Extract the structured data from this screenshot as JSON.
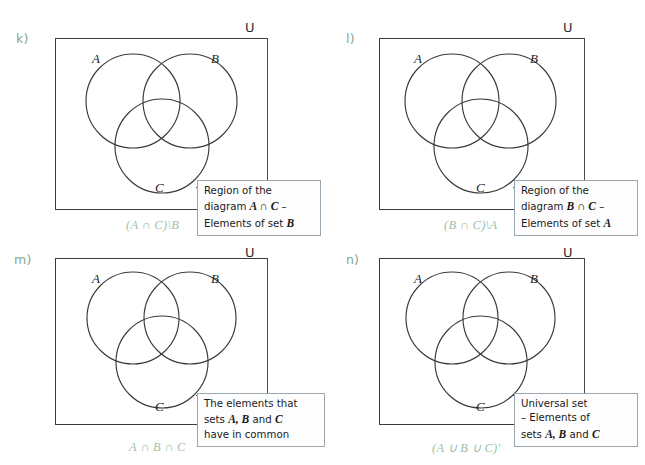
{
  "page": {
    "background": "#ffffff",
    "accent_green": "#9dbfa8",
    "letter_green": "#7fa894",
    "line_color": "#3a3a3a",
    "callout_border": "#9aa7b0"
  },
  "panels": [
    {
      "id": "k",
      "letter": "k)",
      "universe_symbol": "U",
      "set_labels": {
        "a": "A",
        "b": "B",
        "c": "C"
      },
      "formula": "(A ∩ C)\\B",
      "callout_lines": [
        {
          "pre": "Region of the",
          "ital": "",
          "post": ""
        },
        {
          "pre": "diagram ",
          "ital": "A ∩ C",
          "post": " –"
        },
        {
          "pre": "Elements of set ",
          "ital": "B",
          "post": ""
        }
      ]
    },
    {
      "id": "l",
      "letter": "l)",
      "universe_symbol": "U",
      "set_labels": {
        "a": "A",
        "b": "B",
        "c": "C"
      },
      "formula": "(B ∩ C)\\A",
      "callout_lines": [
        {
          "pre": "Region of the",
          "ital": "",
          "post": ""
        },
        {
          "pre": "diagram ",
          "ital": "B ∩ C",
          "post": " –"
        },
        {
          "pre": "Elements of set ",
          "ital": "A",
          "post": ""
        }
      ]
    },
    {
      "id": "m",
      "letter": "m)",
      "universe_symbol": "U",
      "set_labels": {
        "a": "A",
        "b": "B",
        "c": "C"
      },
      "formula": "A ∩ B ∩ C",
      "callout_lines": [
        {
          "pre": "The elements that",
          "ital": "",
          "post": ""
        },
        {
          "pre": "sets ",
          "ital": "A, B",
          "post": " and ",
          "ital2": "C"
        },
        {
          "pre": "have in common",
          "ital": "",
          "post": ""
        }
      ]
    },
    {
      "id": "n",
      "letter": "n)",
      "universe_symbol": "U",
      "set_labels": {
        "a": "A",
        "b": "B",
        "c": "C"
      },
      "formula": "(A ∪ B ∪ C)'",
      "callout_lines": [
        {
          "pre": "Universal set",
          "ital": "",
          "post": ""
        },
        {
          "pre": "– Elements of",
          "ital": "",
          "post": ""
        },
        {
          "pre": "sets ",
          "ital": "A, B",
          "post": " and ",
          "ital2": "C"
        }
      ]
    }
  ]
}
